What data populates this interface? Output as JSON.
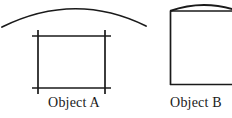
{
  "figure": {
    "background_color": "#ffffff",
    "stroke_color": "#1a1a1a",
    "width": 232,
    "height": 118,
    "objects": [
      {
        "id": "object-a",
        "caption": "Object A",
        "shape": "square-with-overshooting-corner-lines",
        "description": "A square outline whose four sides extend slightly past each corner, forming small crosses at the corners.",
        "square": {
          "left": 38,
          "top": 36,
          "right": 105,
          "bottom": 88
        },
        "overshoot_px": 6
      },
      {
        "id": "arc-over-object-a",
        "caption": "",
        "shape": "arc",
        "description": "A shallow convex arc curving over the square of Object A, open downward.",
        "arc": {
          "start_x": 2,
          "start_y": 27,
          "apex_x": 75,
          "apex_y": 5,
          "end_x": 146,
          "end_y": 26
        }
      },
      {
        "id": "object-b",
        "caption": "Object B",
        "shape": "rectangle-with-bowed-top-edge",
        "description": "A tall rectangle cropped by the right edge of the image; its top edge bows upward into a shallow lens shape.",
        "rect": {
          "left": 170,
          "top": 11,
          "right": 237,
          "bottom": 85
        },
        "top_bow_apex_y": 2
      }
    ]
  },
  "captions": {
    "object_a": "Object A",
    "object_b": "Object B"
  }
}
